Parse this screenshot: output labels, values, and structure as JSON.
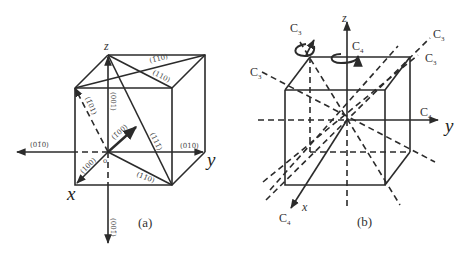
{
  "panel_a": {
    "caption": "(a)",
    "axes": {
      "x": "x",
      "y": "y",
      "z": "z",
      "origin": "o"
    },
    "directions": {
      "d001": "(001)",
      "d00bar1": "(001̄)",
      "d010": "(010)",
      "d0bar10": "(01̄0)",
      "d100": "(100)",
      "dbar100": "(1̄00)",
      "d101": "(1̄01)",
      "d110_top": "(110)",
      "dbar110_top": "(1̄10)",
      "d1bar10": "(11̄0)",
      "d111": "(111̄)"
    }
  },
  "panel_b": {
    "caption": "(b)",
    "axes": {
      "x": "x",
      "y": "y",
      "z": "z"
    },
    "symmetry_labels": {
      "c3_top_left": {
        "main": "C",
        "sub": "3"
      },
      "c4_top": {
        "main": "C",
        "sub": "4"
      },
      "c3_left": {
        "main": "C",
        "sub": "3"
      },
      "c3_top_right_outer": {
        "main": "C",
        "sub": "3"
      },
      "c3_top_right_inner": {
        "main": "C",
        "sub": "3"
      },
      "c4_right": {
        "main": "C",
        "sub": "4"
      },
      "c4_bottom": {
        "main": "C",
        "sub": "4"
      }
    }
  },
  "colors": {
    "line": "#2b2b2b",
    "text": "#333333",
    "background": "#ffffff"
  }
}
